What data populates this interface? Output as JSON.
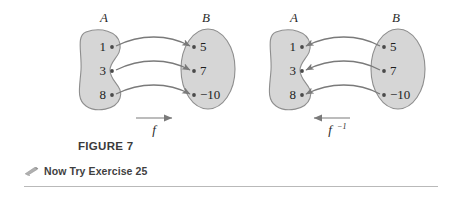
{
  "figure": {
    "caption": "FIGURE 7",
    "try_text": "Now Try Exercise 25",
    "pencil_icon": "pencil-icon",
    "colors": {
      "set_fill": "#d6d6d6",
      "set_stroke": "#8e8e8e",
      "arrow": "#7a7a7a",
      "text": "#1d1d1d",
      "rule": "#b9b9b9",
      "background": "#ffffff"
    }
  },
  "diagrams": [
    {
      "id": "forward-mapping",
      "function_label": "f",
      "function_exponent": "",
      "direction": "right",
      "domain": {
        "name": "A",
        "shape": "kidney",
        "elements": [
          "1",
          "3",
          "8"
        ]
      },
      "codomain": {
        "name": "B",
        "shape": "oval",
        "elements": [
          "5",
          "7",
          "−10"
        ]
      },
      "mappings": [
        {
          "from": "1",
          "to": "5"
        },
        {
          "from": "3",
          "to": "7"
        },
        {
          "from": "8",
          "to": "−10"
        }
      ]
    },
    {
      "id": "inverse-mapping",
      "function_label": "f",
      "function_exponent": "−1",
      "direction": "left",
      "domain": {
        "name": "A",
        "shape": "kidney",
        "elements": [
          "1",
          "3",
          "8"
        ]
      },
      "codomain": {
        "name": "B",
        "shape": "oval",
        "elements": [
          "5",
          "7",
          "−10"
        ]
      },
      "mappings": [
        {
          "from": "5",
          "to": "1"
        },
        {
          "from": "7",
          "to": "3"
        },
        {
          "from": "−10",
          "to": "8"
        }
      ]
    }
  ]
}
